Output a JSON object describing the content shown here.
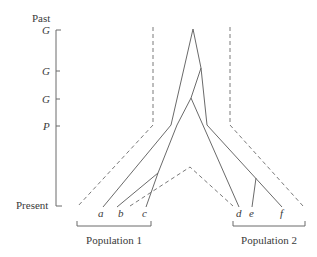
{
  "figure": {
    "axis": {
      "top_label": "Past",
      "bottom_label": "Present",
      "ticks": [
        {
          "label": "G",
          "y": 30
        },
        {
          "label": "G",
          "y": 71
        },
        {
          "label": "G",
          "y": 99
        },
        {
          "label": "P",
          "y": 126
        }
      ]
    },
    "leaves": [
      {
        "label": "a",
        "x": 101
      },
      {
        "label": "b",
        "x": 121
      },
      {
        "label": "c",
        "x": 145
      },
      {
        "label": "d",
        "x": 240
      },
      {
        "label": "e",
        "x": 252
      },
      {
        "label": "f",
        "x": 283
      }
    ],
    "populations": [
      {
        "label": "Population 1",
        "x1": 78,
        "x2": 151
      },
      {
        "label": "Population 2",
        "x1": 232,
        "x2": 305
      }
    ]
  }
}
